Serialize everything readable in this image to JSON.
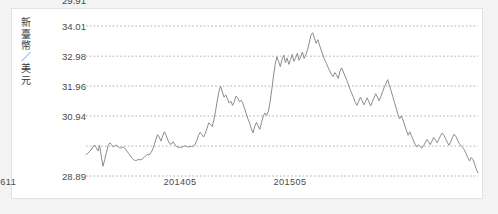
{
  "chart_data": {
    "type": "line",
    "title": "",
    "subtitle": "",
    "ylabel": "新臺幣／美元",
    "xlabel": "",
    "grid": true,
    "legend": null,
    "ylim": [
      28.89,
      34.01
    ],
    "ytick_labels": [
      "34.01",
      "32.98",
      "31.96",
      "30.94",
      "29.91",
      "28.89"
    ],
    "ytick_values": [
      34.01,
      32.98,
      31.96,
      30.94,
      29.91,
      28.89
    ],
    "xtick_labels": [
      "201405",
      "201505",
      "201611"
    ],
    "xtick_positions": [
      0.273,
      0.555,
      0.805
    ],
    "series": [
      {
        "name": "新臺幣／美元",
        "color": "#8c8c8c",
        "values": [
          29.62,
          29.66,
          29.72,
          29.78,
          29.88,
          29.95,
          29.86,
          29.74,
          29.93,
          29.55,
          29.22,
          29.46,
          29.7,
          29.93,
          30.02,
          29.96,
          29.88,
          29.93,
          29.94,
          29.88,
          29.84,
          29.86,
          29.88,
          29.82,
          29.74,
          29.66,
          29.58,
          29.5,
          29.44,
          29.42,
          29.43,
          29.46,
          29.44,
          29.47,
          29.52,
          29.58,
          29.63,
          29.6,
          29.68,
          29.78,
          29.95,
          30.14,
          30.3,
          30.22,
          30.08,
          30.26,
          30.4,
          30.28,
          30.12,
          30.0,
          29.97,
          30.06,
          29.98,
          29.9,
          29.87,
          29.88,
          29.86,
          29.89,
          29.92,
          29.9,
          29.88,
          29.9,
          29.89,
          29.91,
          29.96,
          30.1,
          30.28,
          30.38,
          30.3,
          30.22,
          30.34,
          30.52,
          30.7,
          30.66,
          30.58,
          30.8,
          31.1,
          31.45,
          31.78,
          31.95,
          31.76,
          31.58,
          31.66,
          31.52,
          31.38,
          31.44,
          31.3,
          31.42,
          31.62,
          31.56,
          31.42,
          31.48,
          31.38,
          31.2,
          31.02,
          30.84,
          30.7,
          30.5,
          30.36,
          30.58,
          30.72,
          30.6,
          30.48,
          30.72,
          30.94,
          31.04,
          30.96,
          31.1,
          31.42,
          31.84,
          32.3,
          32.7,
          32.96,
          32.8,
          32.62,
          32.86,
          33.02,
          32.76,
          32.92,
          32.7,
          32.86,
          33.04,
          32.8,
          32.92,
          33.08,
          32.84,
          32.96,
          33.12,
          32.9,
          33.04,
          33.2,
          33.44,
          33.7,
          33.78,
          33.6,
          33.42,
          33.54,
          33.36,
          33.18,
          33.02,
          32.86,
          32.74,
          32.6,
          32.48,
          32.36,
          32.28,
          32.42,
          32.34,
          32.22,
          32.46,
          32.58,
          32.44,
          32.3,
          32.16,
          32.0,
          31.84,
          31.7,
          31.56,
          31.4,
          31.3,
          31.44,
          31.58,
          31.46,
          31.32,
          31.44,
          31.56,
          31.42,
          31.28,
          31.42,
          31.56,
          31.7,
          31.58,
          31.46,
          31.6,
          31.76,
          31.92,
          32.04,
          32.18,
          31.98,
          31.8,
          31.6,
          31.4,
          31.2,
          31.0,
          30.84,
          30.94,
          30.8,
          30.62,
          30.44,
          30.28,
          30.4,
          30.26,
          30.12,
          29.98,
          29.88,
          29.96,
          29.9,
          29.84,
          29.92,
          30.02,
          30.14,
          30.06,
          29.96,
          30.08,
          30.2,
          30.12,
          30.02,
          30.14,
          30.26,
          30.36,
          30.28,
          30.16,
          30.04,
          29.94,
          30.06,
          30.2,
          30.32,
          30.24,
          30.12,
          30.0,
          29.92,
          29.86,
          29.78,
          29.66,
          29.52,
          29.4,
          29.52,
          29.46,
          29.3,
          29.12,
          29.0
        ]
      }
    ]
  },
  "axis": {
    "ylabel_text": "新臺幣／美元",
    "yticks": [
      "34.01",
      "32.98",
      "31.96",
      "30.94",
      "29.91",
      "28.89"
    ],
    "xticks": [
      "201405",
      "201505",
      "201611"
    ]
  },
  "colors": {
    "line": "#8c8c8c",
    "grid": "#9a9a9a",
    "card_background": "#ffffff",
    "page_background": "#f3f3f3",
    "text": "#4a4a4a"
  }
}
